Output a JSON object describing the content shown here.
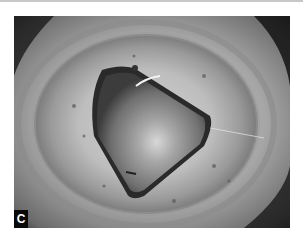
{
  "figure": {
    "panel_label": "C",
    "colors": {
      "label_bg": "#0a0a0a",
      "label_text": "#ffffff",
      "background": "#ffffff"
    }
  }
}
